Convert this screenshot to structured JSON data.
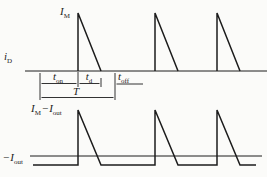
{
  "figure": {
    "background": "#fbfbf9",
    "line_color": "#1c1c1c",
    "type": "switching-converter-current-waveforms"
  },
  "labels": {
    "i_d": {
      "base": "i",
      "sub": "D"
    },
    "i_m": {
      "base": "I",
      "sub": "M"
    },
    "t_on": {
      "base": "t",
      "sub": "on"
    },
    "t_d": {
      "base": "t",
      "sub": "d"
    },
    "t_off": {
      "base": "t",
      "sub": "off"
    },
    "period": "T",
    "im_minus_iout": {
      "p1_base": "I",
      "p1_sub": "M",
      "operator": "−",
      "p2_base": "I",
      "p2_sub": "out"
    },
    "neg_iout": {
      "sign": "−",
      "base": "I",
      "sub": "out"
    }
  },
  "geometry": {
    "top": {
      "axis_y": 71,
      "axis_x": [
        25,
        267
      ],
      "peak_y": 13,
      "pulses": [
        {
          "rise_x": 78,
          "fall_x": 101
        },
        {
          "rise_x": 155,
          "fall_x": 178
        },
        {
          "rise_x": 217,
          "fall_x": 240
        }
      ]
    },
    "bottom": {
      "zero_y": 156,
      "zero_x": [
        30,
        262
      ],
      "base_y": 165,
      "peak_y": 110,
      "wave_x": [
        33,
        256
      ],
      "pulses": [
        {
          "rise_x": 78,
          "fall_x": 101
        },
        {
          "rise_x": 155,
          "fall_x": 178
        },
        {
          "rise_x": 217,
          "fall_x": 240
        }
      ]
    },
    "dims": {
      "ext_lines": [
        {
          "x": 40,
          "y1": 73,
          "y2": 100
        },
        {
          "x": 78,
          "y1": 72,
          "y2": 87
        },
        {
          "x": 101,
          "y1": 78,
          "y2": 87
        },
        {
          "x": 115,
          "y1": 73,
          "y2": 100
        }
      ],
      "t_on_arrow": {
        "x1": 41.5,
        "x2": 76.5,
        "y": 83.5,
        "heads": "both"
      },
      "t_d_arrow": {
        "x1": 79.5,
        "x2": 99.5,
        "y": 83.5,
        "heads": "both"
      },
      "t_off_arrow": {
        "x1": 116.5,
        "x2": 143,
        "y": 84,
        "heads": "start"
      },
      "period_arrow": {
        "x1": 41.5,
        "x2": 113.5,
        "y": 97.5,
        "heads": "both"
      }
    }
  }
}
